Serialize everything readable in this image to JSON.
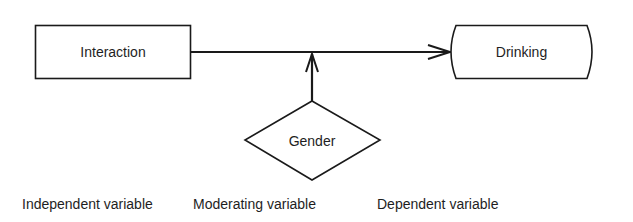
{
  "diagram": {
    "type": "moderating-variable-model",
    "nodes": {
      "independent": {
        "label": "Interaction",
        "shape": "rectangle"
      },
      "moderator": {
        "label": "Gender",
        "shape": "diamond"
      },
      "dependent": {
        "label": "Drinking",
        "shape": "rounded-terminal"
      }
    },
    "edges": [
      {
        "from": "Interaction",
        "to": "Drinking",
        "style": "arrow"
      },
      {
        "from": "Gender",
        "to": "Interaction→Drinking path",
        "style": "arrow"
      }
    ],
    "captions": {
      "independent": "Independent variable",
      "moderator": "Moderating variable",
      "dependent": "Dependent variable"
    },
    "colors": {
      "stroke": "#1a1a1a",
      "background": "#ffffff"
    }
  }
}
